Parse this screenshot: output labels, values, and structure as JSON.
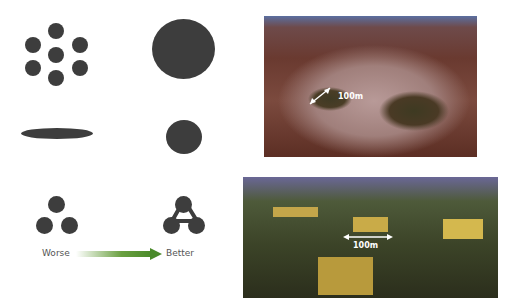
{
  "diagram": {
    "panels": [
      {
        "name": "fragmented-small-patches",
        "quality": "worse"
      },
      {
        "name": "single-large-patch",
        "quality": "better"
      },
      {
        "name": "elongated-patch",
        "quality": "worse"
      },
      {
        "name": "compact-round-patch",
        "quality": "better"
      },
      {
        "name": "isolated-patches",
        "quality": "worse"
      },
      {
        "name": "connected-patches",
        "quality": "better"
      }
    ],
    "arrow": {
      "from_label": "Worse",
      "to_label": "Better",
      "color": "#4a8a2a"
    }
  },
  "photos": [
    {
      "name": "deforested-fragments-photo",
      "scale_label": "100m"
    },
    {
      "name": "forest-clearings-photo",
      "scale_label": "100m"
    }
  ]
}
